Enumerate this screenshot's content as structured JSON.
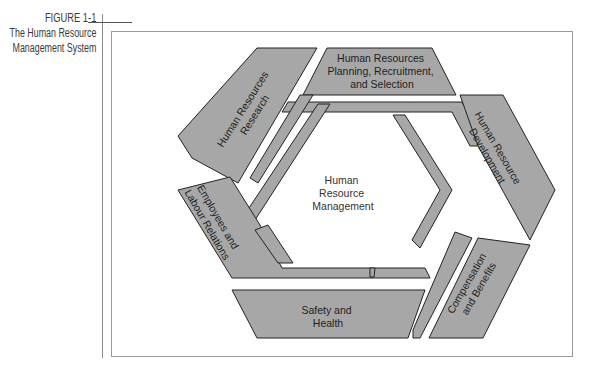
{
  "figure": {
    "number": "FIGURE 1-1",
    "title_line1": "The Human Resource",
    "title_line2": "Management System"
  },
  "diagram": {
    "center": {
      "line1": "Human",
      "line2": "Resource",
      "line3": "Management"
    },
    "segments": [
      {
        "id": "research",
        "line1": "Human Resources",
        "line2": "Research"
      },
      {
        "id": "planning",
        "line1": "Human Resources",
        "line2": "Planning, Recruitment,",
        "line3": "and Selection"
      },
      {
        "id": "development",
        "line1": "Human Resource",
        "line2": "Development"
      },
      {
        "id": "compensation",
        "line1": "Compensation",
        "line2": "and Benefits"
      },
      {
        "id": "safety",
        "line1": "Safety and",
        "line2": "Health"
      },
      {
        "id": "relations",
        "line1": "Employees and",
        "line2": "Labour Relations"
      }
    ],
    "colors": {
      "band_fill": "#a7a7a7",
      "outline": "#222222"
    }
  }
}
